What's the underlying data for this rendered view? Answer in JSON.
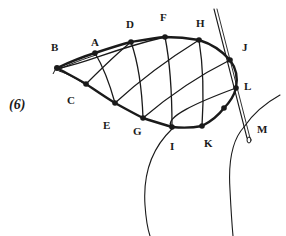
{
  "figure_label": "(6)",
  "colors": {
    "ink": "#1a1a1a",
    "background": "#ffffff"
  },
  "points": [
    {
      "id": "B",
      "label": "B",
      "x": 57,
      "y": 68,
      "lx": 51,
      "ly": 42
    },
    {
      "id": "A",
      "label": "A",
      "x": 95,
      "y": 53,
      "lx": 91,
      "ly": 37
    },
    {
      "id": "D",
      "label": "D",
      "x": 131,
      "y": 42,
      "lx": 126,
      "ly": 19
    },
    {
      "id": "F",
      "label": "F",
      "x": 165,
      "y": 37,
      "lx": 160,
      "ly": 12
    },
    {
      "id": "H",
      "label": "H",
      "x": 199,
      "y": 40,
      "lx": 196,
      "ly": 18
    },
    {
      "id": "J",
      "label": "J",
      "x": 230,
      "y": 60,
      "lx": 242,
      "ly": 42
    },
    {
      "id": "L",
      "label": "L",
      "x": 236,
      "y": 88,
      "lx": 244,
      "ly": 81
    },
    {
      "id": "P",
      "label": "",
      "x": 224,
      "y": 108
    },
    {
      "id": "K",
      "label": "K",
      "x": 202,
      "y": 126,
      "lx": 204,
      "ly": 138
    },
    {
      "id": "I",
      "label": "I",
      "x": 172,
      "y": 127,
      "lx": 170,
      "ly": 141
    },
    {
      "id": "G",
      "label": "G",
      "x": 143,
      "y": 118,
      "lx": 133,
      "ly": 126
    },
    {
      "id": "E",
      "label": "E",
      "x": 115,
      "y": 103,
      "lx": 103,
      "ly": 120
    },
    {
      "id": "C",
      "label": "C",
      "x": 86,
      "y": 84,
      "lx": 67,
      "ly": 95
    }
  ],
  "needle_label": {
    "label": "M",
    "lx": 257,
    "ly": 124
  }
}
